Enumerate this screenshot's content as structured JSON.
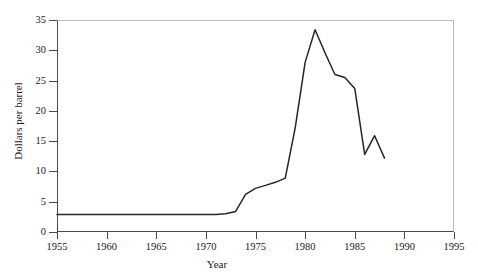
{
  "caption": {
    "cropped_text": ""
  },
  "chart_data": {
    "type": "line",
    "title": "",
    "xlabel": "Year",
    "ylabel": "Dollars per barrel",
    "xlim": [
      1955,
      1995
    ],
    "ylim": [
      0,
      35
    ],
    "xticks": [
      1955,
      1960,
      1965,
      1970,
      1975,
      1980,
      1985,
      1990,
      1995
    ],
    "yticks": [
      0,
      5,
      10,
      15,
      20,
      25,
      30,
      35
    ],
    "grid": false,
    "legend": null,
    "line_color": "#262626",
    "series": [
      {
        "name": "Crude oil price",
        "x": [
          1955,
          1960,
          1965,
          1970,
          1971,
          1972,
          1973,
          1974,
          1975,
          1976,
          1977,
          1978,
          1979,
          1980,
          1981,
          1982,
          1983,
          1984,
          1985,
          1986,
          1987,
          1988
        ],
        "values": [
          2.9,
          2.9,
          2.9,
          2.9,
          2.9,
          3.0,
          3.4,
          6.2,
          7.2,
          7.7,
          8.2,
          8.9,
          17.2,
          28.0,
          33.4,
          29.6,
          26.0,
          25.5,
          23.7,
          12.8,
          15.9,
          12.2
        ]
      }
    ]
  }
}
